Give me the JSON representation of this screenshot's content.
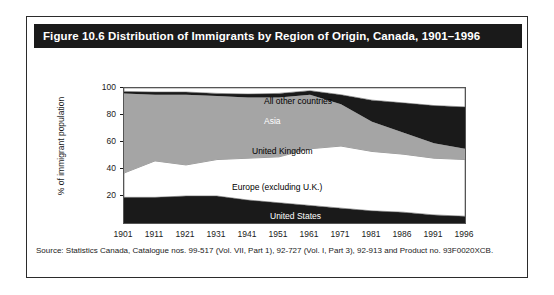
{
  "figure": {
    "title": "Figure 10.6 Distribution of Immigrants by Region of Origin, Canada, 1901–1996",
    "source": "Source: Statistics Canada, Catalogue nos. 99-517 (Vol. VII, Part 1), 92-727 (Vol. I, Part 3), 92-913 and Product no. 93F0020XCB."
  },
  "colors": {
    "title_bar": "#1a1a1a",
    "title_text": "#ffffff",
    "frame": "#2b2b2b",
    "plot_border": "#555555",
    "black_band": "#1a1a1a",
    "grey_band": "#a5a5a5",
    "white_band": "#ffffff",
    "text": "#1a1a1a"
  },
  "chart_data": {
    "type": "area",
    "title": "Distribution of Immigrants by Region of Origin, Canada, 1901–1996",
    "xlabel": "",
    "ylabel": "% of immigrant population",
    "ylim": [
      0,
      100
    ],
    "yticks": [
      20,
      40,
      60,
      80,
      100
    ],
    "grid": false,
    "legend": "in-plot band labels",
    "stacked": true,
    "categories": [
      "1901",
      "1911",
      "1921",
      "1931",
      "1941",
      "1951",
      "1961",
      "1971",
      "1981",
      "1986",
      "1991",
      "1996"
    ],
    "series": [
      {
        "name": "United States",
        "color": "#1a1a1a",
        "values": [
          19,
          19,
          20,
          20,
          17,
          15,
          13,
          11,
          9,
          8,
          6,
          5
        ]
      },
      {
        "name": "Europe (excluding U.K.)",
        "color": "#ffffff",
        "values": [
          18,
          27,
          23,
          27,
          31,
          34,
          42,
          46,
          44,
          43,
          42,
          42
        ]
      },
      {
        "name": "United Kingdom",
        "color": "#a5a5a5",
        "values": [
          59,
          49,
          52,
          47,
          45,
          44,
          40,
          31,
          22,
          16,
          11,
          8
        ]
      },
      {
        "name": "Asia",
        "color": "#1a1a1a",
        "values": [
          1.5,
          2,
          2,
          2,
          2.5,
          3,
          3,
          7,
          16,
          22,
          28,
          31
        ]
      },
      {
        "name": "All other countries",
        "color": "#ffffff",
        "values": [
          2.5,
          3,
          3,
          4,
          4.5,
          4,
          2,
          5,
          9,
          11,
          13,
          14
        ]
      }
    ],
    "cumulative_tops": {
      "united_states": [
        19,
        19,
        20,
        20,
        17,
        15,
        13,
        11,
        9,
        8,
        6,
        5
      ],
      "europe_excluding_uk": [
        37,
        46,
        43,
        47,
        48,
        49,
        55,
        57,
        53,
        51,
        48,
        47
      ],
      "united_kingdom": [
        96,
        95,
        95,
        94,
        93,
        93,
        95,
        88,
        75,
        67,
        59,
        55
      ],
      "asia": [
        97.5,
        97,
        97,
        96,
        95.5,
        96,
        98,
        95,
        91,
        89,
        87,
        86
      ],
      "all_other_countries": [
        100,
        100,
        100,
        100,
        100,
        100,
        100,
        100,
        100,
        100,
        100,
        100
      ]
    },
    "band_labels": [
      {
        "text": "All other countries",
        "color": "#1a1a1a"
      },
      {
        "text": "Asia",
        "color": "#ffffff"
      },
      {
        "text": "United Kingdom",
        "color": "#1a1a1a"
      },
      {
        "text": "Europe (excluding U.K.)",
        "color": "#1a1a1a"
      },
      {
        "text": "United States",
        "color": "#ffffff"
      }
    ]
  }
}
